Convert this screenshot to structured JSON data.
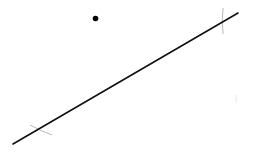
{
  "diagram": {
    "background": "#ffffff",
    "line": {
      "x1": 13,
      "y1": 144,
      "x2": 238,
      "y2": 13,
      "color": "#111111",
      "width": 1.6
    },
    "point": {
      "cx": 95.5,
      "cy": 18.5,
      "r": 2.8,
      "color": "#000000"
    },
    "arcs": [
      {
        "d": "M 223 8 Q 221.5 21 223 34",
        "color": "#b8b8b8",
        "width": 1
      },
      {
        "d": "M 30 125 Q 41 131 52 135",
        "color": "#b8b8b8",
        "width": 1
      },
      {
        "d": "M 236 95 Q 236.5 99 236 103",
        "color": "#e4e4e4",
        "width": 0.8
      }
    ]
  }
}
